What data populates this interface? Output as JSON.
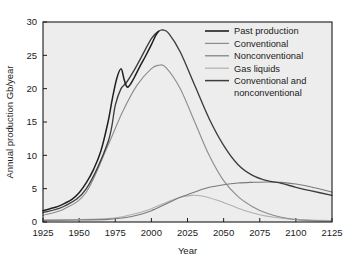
{
  "chart_data": {
    "type": "line",
    "title": "",
    "xlabel": "Year",
    "ylabel": "Annual production Gb/year",
    "xlim": [
      1925,
      2125
    ],
    "ylim": [
      0,
      30
    ],
    "xticks": [
      1925,
      1950,
      1975,
      2000,
      2025,
      2050,
      2075,
      2100,
      2125
    ],
    "yticks": [
      0,
      5,
      10,
      15,
      20,
      25,
      30
    ],
    "grid": false,
    "legend_position": "top-right",
    "plot_background": "#ededed",
    "axis_color": "#1a1a1a",
    "series": [
      {
        "name": "Past production",
        "color": "#1f1f1f",
        "x": [
          1925,
          1930,
          1935,
          1940,
          1945,
          1950,
          1955,
          1960,
          1965,
          1970,
          1973,
          1976,
          1979,
          1981,
          1983,
          1985,
          1988,
          1992,
          1996,
          2000,
          2003,
          2005
        ],
        "values": [
          1.7,
          2.0,
          2.3,
          2.8,
          3.4,
          4.4,
          5.9,
          7.9,
          10.6,
          15.0,
          18.5,
          21.5,
          23.0,
          21.5,
          20.3,
          20.5,
          21.6,
          23.3,
          24.9,
          26.6,
          28.0,
          28.6
        ]
      },
      {
        "name": "Conventional",
        "color": "#8c8c8c",
        "x": [
          1925,
          1940,
          1955,
          1970,
          1980,
          1990,
          2000,
          2005,
          2010,
          2020,
          2030,
          2040,
          2050,
          2060,
          2070,
          2080,
          2090,
          2100,
          2110,
          2125
        ],
        "values": [
          1.0,
          2.0,
          4.5,
          11.5,
          16.5,
          20.5,
          23.0,
          23.5,
          23.2,
          20.0,
          15.0,
          10.0,
          6.2,
          3.8,
          2.3,
          1.3,
          0.7,
          0.35,
          0.2,
          0.1
        ]
      },
      {
        "name": "Nonconventional",
        "color": "#7a7a7a",
        "x": [
          1925,
          1950,
          1970,
          1980,
          1990,
          2000,
          2010,
          2020,
          2030,
          2040,
          2050,
          2060,
          2070,
          2080,
          2090,
          2100,
          2110,
          2125
        ],
        "values": [
          0.25,
          0.3,
          0.4,
          0.6,
          1.0,
          1.7,
          2.7,
          3.7,
          4.5,
          5.2,
          5.6,
          5.85,
          5.95,
          6.0,
          5.95,
          5.7,
          5.3,
          4.5
        ]
      },
      {
        "name": "Gas liquids",
        "color": "#b0b0b0",
        "x": [
          1925,
          1950,
          1970,
          1980,
          1990,
          2000,
          2010,
          2020,
          2028,
          2035,
          2045,
          2055,
          2065,
          2075,
          2085,
          2095,
          2110,
          2125
        ],
        "values": [
          0.3,
          0.35,
          0.5,
          0.8,
          1.3,
          2.0,
          2.9,
          3.7,
          4.0,
          3.9,
          3.3,
          2.5,
          1.7,
          1.1,
          0.7,
          0.45,
          0.3,
          0.2
        ]
      },
      {
        "name": "Conventional and nonconventional",
        "color": "#3d3d3d",
        "x": [
          1925,
          1940,
          1955,
          1970,
          1975,
          1979,
          1983,
          1990,
          2000,
          2005,
          2008,
          2012,
          2020,
          2030,
          2040,
          2050,
          2060,
          2070,
          2080,
          2090,
          2100,
          2110,
          2125
        ],
        "values": [
          1.4,
          2.4,
          5.0,
          12.0,
          17.5,
          20.0,
          21.0,
          23.5,
          27.5,
          28.6,
          28.8,
          28.3,
          25.5,
          20.5,
          15.5,
          11.5,
          8.6,
          7.0,
          6.2,
          5.8,
          5.2,
          4.7,
          4.0
        ]
      }
    ],
    "legend": [
      {
        "label": "Past production",
        "color": "#1f1f1f"
      },
      {
        "label": "Conventional",
        "color": "#8c8c8c"
      },
      {
        "label": "Nonconventional",
        "color": "#7a7a7a"
      },
      {
        "label": "Gas liquids",
        "color": "#b0b0b0"
      },
      {
        "label": "Conventional and",
        "label2": "nonconventional",
        "color": "#3d3d3d"
      }
    ]
  }
}
